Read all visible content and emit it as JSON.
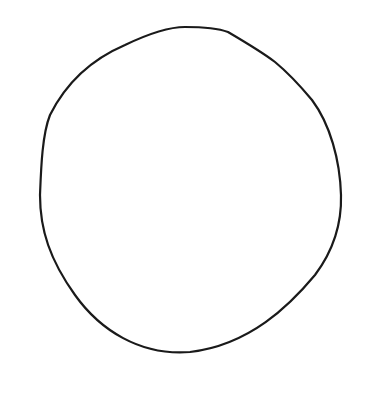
{
  "drawing": {
    "subject": "hand-drawn circle outline",
    "stroke_color": "#1a1a1a",
    "background_color": "#ffffff",
    "stroke_width": 2.2
  }
}
